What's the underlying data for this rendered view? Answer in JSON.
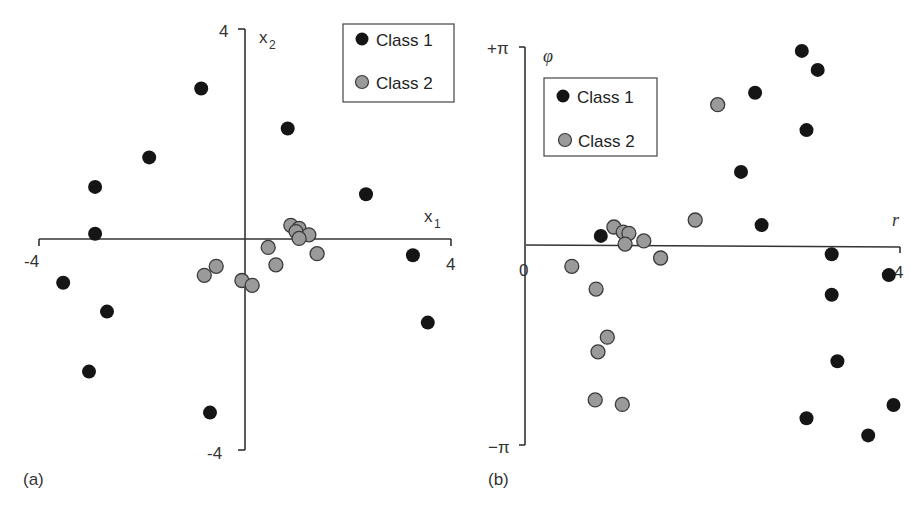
{
  "figure": {
    "panels": [
      "(a)",
      "(b)"
    ]
  },
  "colors": {
    "class1_fill": "#151515",
    "class2_fill": "#9a9a9a",
    "class2_stroke": "#3a3a3a",
    "axis": "#333333"
  },
  "chart_data": [
    {
      "type": "scatter",
      "panel_label": "(a)",
      "title": "",
      "xlabel": "x1",
      "ylabel": "x2",
      "xlim": [
        -4,
        4
      ],
      "ylim": [
        -4,
        4
      ],
      "x_ticks": [
        "-4",
        "4"
      ],
      "y_ticks": [
        "4",
        "-4"
      ],
      "grid": false,
      "legend_position": "top-right",
      "series": [
        {
          "name": "Class 1",
          "points": [
            [
              -0.85,
              2.87
            ],
            [
              0.83,
              2.11
            ],
            [
              -1.86,
              1.56
            ],
            [
              -2.91,
              1.0
            ],
            [
              -2.91,
              0.11
            ],
            [
              2.35,
              0.86
            ],
            [
              -3.53,
              -0.82
            ],
            [
              3.26,
              -0.3
            ],
            [
              -2.68,
              -1.37
            ],
            [
              3.55,
              -1.58
            ],
            [
              -3.03,
              -2.51
            ],
            [
              -0.68,
              -3.29
            ]
          ]
        },
        {
          "name": "Class 2",
          "points": [
            [
              0.89,
              0.27
            ],
            [
              1.05,
              0.21
            ],
            [
              0.99,
              0.15
            ],
            [
              1.24,
              0.09
            ],
            [
              1.05,
              0.02
            ],
            [
              0.45,
              -0.15
            ],
            [
              1.4,
              -0.27
            ],
            [
              0.6,
              -0.48
            ],
            [
              -0.56,
              -0.51
            ],
            [
              -0.79,
              -0.68
            ],
            [
              -0.06,
              -0.78
            ],
            [
              0.14,
              -0.87
            ]
          ]
        }
      ]
    },
    {
      "type": "scatter",
      "panel_label": "(b)",
      "title": "",
      "xlabel": "r",
      "ylabel": "φ",
      "xlim": [
        0,
        4
      ],
      "ylim": [
        -3.1416,
        3.1416
      ],
      "x_ticks": [
        "0",
        "4"
      ],
      "y_ticks": [
        "+π",
        "−π"
      ],
      "grid": false,
      "legend_position": "top-left",
      "series": [
        {
          "name": "Class 1",
          "points": [
            [
              2.95,
              3.08
            ],
            [
              3.12,
              2.78
            ],
            [
              2.45,
              2.42
            ],
            [
              3.0,
              1.83
            ],
            [
              2.3,
              1.17
            ],
            [
              2.52,
              0.33
            ],
            [
              0.8,
              0.16
            ],
            [
              3.27,
              -0.13
            ],
            [
              3.88,
              -0.46
            ],
            [
              3.27,
              -0.77
            ],
            [
              3.33,
              -1.82
            ],
            [
              3.93,
              -2.51
            ],
            [
              3.0,
              -2.72
            ],
            [
              3.66,
              -2.99
            ]
          ]
        },
        {
          "name": "Class 2",
          "points": [
            [
              2.05,
              2.23
            ],
            [
              1.81,
              0.41
            ],
            [
              0.94,
              0.3
            ],
            [
              1.04,
              0.22
            ],
            [
              1.1,
              0.2
            ],
            [
              1.06,
              0.03
            ],
            [
              1.26,
              0.08
            ],
            [
              1.44,
              -0.19
            ],
            [
              0.49,
              -0.32
            ],
            [
              0.75,
              -0.68
            ],
            [
              0.87,
              -1.44
            ],
            [
              0.77,
              -1.67
            ],
            [
              0.74,
              -2.43
            ],
            [
              1.03,
              -2.5
            ]
          ]
        }
      ]
    }
  ]
}
